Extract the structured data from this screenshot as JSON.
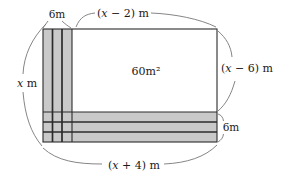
{
  "figure": {
    "area_label": "60m²",
    "labels": {
      "strip_width_top": "6m",
      "strip_height_right": "6m",
      "top_width": {
        "open": "(",
        "var": "x",
        "rest": " − 2) m"
      },
      "left_height": {
        "var": "x",
        "rest": " m"
      },
      "right_height": {
        "open": "(",
        "var": "x",
        "rest": " − 6) m"
      },
      "bottom_width": {
        "open": "(",
        "var": "x",
        "rest": " + 4) m"
      }
    },
    "colors": {
      "strip_fill": "#c9c9c9",
      "line": "#2b2b2b",
      "arc": "#777777",
      "text": "#1a1a1a",
      "background": "#ffffff"
    }
  }
}
